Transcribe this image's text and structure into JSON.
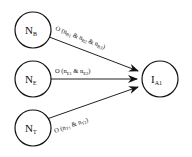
{
  "diagram": {
    "nodes": [
      {
        "id": "NB",
        "main": "N",
        "sub": "B"
      },
      {
        "id": "NE",
        "main": "N",
        "sub": "E"
      },
      {
        "id": "NT",
        "main": "N",
        "sub": "T"
      },
      {
        "id": "IA1",
        "main": "I",
        "sub": "A1"
      }
    ],
    "edges": [
      {
        "from": "NB",
        "to": "IA1",
        "label": {
          "prefix": "O (",
          "parts": [
            {
              "n": "n",
              "s": "B1"
            },
            {
              "n": "n",
              "s": "B2"
            },
            {
              "n": "n",
              "s": "B3"
            }
          ],
          "sep": " & ",
          "suffix": ")"
        }
      },
      {
        "from": "NE",
        "to": "IA1",
        "label": {
          "prefix": "O (",
          "parts": [
            {
              "n": "n",
              "s": "E1"
            },
            {
              "n": "n",
              "s": "E2"
            }
          ],
          "sep": " & ",
          "suffix": ")"
        }
      },
      {
        "from": "NT",
        "to": "IA1",
        "label": {
          "prefix": "O (",
          "parts": [
            {
              "n": "n",
              "s": "T1"
            },
            {
              "n": "n",
              "s": "T2"
            }
          ],
          "sep": " & ",
          "suffix": ")"
        }
      }
    ],
    "colors": {
      "stroke": "#111111",
      "background": "#ffffff"
    }
  }
}
